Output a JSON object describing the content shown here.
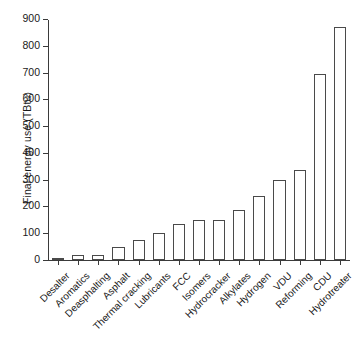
{
  "chart_data": {
    "type": "bar",
    "title": "",
    "xlabel": "",
    "ylabel": "Final energy use (TBtu)",
    "ylim": [
      0,
      900
    ],
    "yticks": [
      0,
      100,
      200,
      300,
      400,
      500,
      600,
      700,
      800,
      900
    ],
    "grid": false,
    "legend": null,
    "categories": [
      "Desalter",
      "Aromatics",
      "Deasphalting",
      "Asphalt",
      "Thermal cracking",
      "Lubricants",
      "FCC",
      "Isomers",
      "Hydrocracker",
      "Alkylates",
      "Hydrogen",
      "VDU",
      "Reforming",
      "CDU",
      "Hydrotreater"
    ],
    "values": [
      4,
      17,
      18,
      48,
      75,
      100,
      135,
      150,
      150,
      185,
      240,
      300,
      335,
      695,
      872
    ],
    "bar_facecolor": "#ffffff",
    "bar_edgecolor": "#4a4a4a",
    "axis_color": "#3a3a3a",
    "tick_label_rotation": -45
  }
}
